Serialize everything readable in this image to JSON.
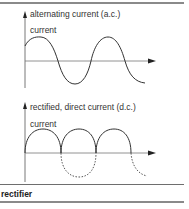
{
  "diagram": {
    "top_panel": {
      "title": "alternating current (a.c.)",
      "axis_label": "current"
    },
    "bottom_panel": {
      "title": "rectified, direct current (d.c.)",
      "axis_label": "current"
    },
    "caption": "rectifier",
    "colors": {
      "line": "#333333",
      "axis": "#555555",
      "rule": "#777777"
    }
  }
}
